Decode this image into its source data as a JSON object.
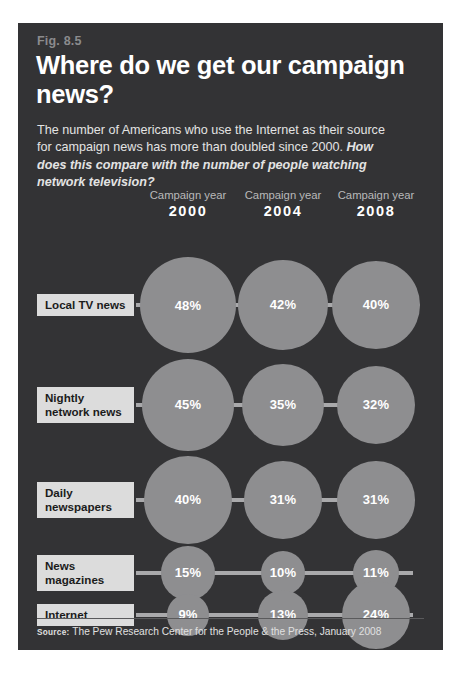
{
  "figure": {
    "number": "Fig. 8.5",
    "headline": "Where do we get our campaign news?",
    "deck_plain": "The number of Americans who use the Internet as their source for campaign news has more than doubled since 2000. ",
    "deck_question": "How does this compare with the number of people watching network television?",
    "source_kicker": "Source:",
    "source_text": " The Pew Research Center for the People & the Press, January 2008",
    "colors": {
      "panel_background": "#333335",
      "bubble": "#8e8e90",
      "connector": "#a9a9ab",
      "label_box": "#dcdcdc",
      "fig_number": "#8b8b8d",
      "headline": "#ffffff"
    }
  },
  "chart_data": {
    "type": "bubble",
    "title": "Where do we get our campaign news?",
    "xlabel": "Campaign year",
    "ylabel": "News source",
    "value_unit": "%",
    "column_header_label": "Campaign year",
    "categories": [
      "2000",
      "2004",
      "2008"
    ],
    "series": [
      {
        "name": "Local TV news",
        "values": [
          48,
          42,
          40
        ],
        "labels": [
          "48%",
          "42%",
          "40%"
        ]
      },
      {
        "name": "Nightly network news",
        "values": [
          45,
          35,
          32
        ],
        "labels": [
          "45%",
          "35%",
          "32%"
        ]
      },
      {
        "name": "Daily newspapers",
        "values": [
          40,
          31,
          31
        ],
        "labels": [
          "40%",
          "31%",
          "31%"
        ]
      },
      {
        "name": "News magazines",
        "values": [
          15,
          10,
          11
        ],
        "labels": [
          "15%",
          "10%",
          "11%"
        ]
      },
      {
        "name": "Internet",
        "values": [
          9,
          13,
          24
        ],
        "labels": [
          "9%",
          "13%",
          "24%"
        ]
      }
    ],
    "legend": "none",
    "grid": false,
    "note": "Bubble area scales with percentage value"
  }
}
